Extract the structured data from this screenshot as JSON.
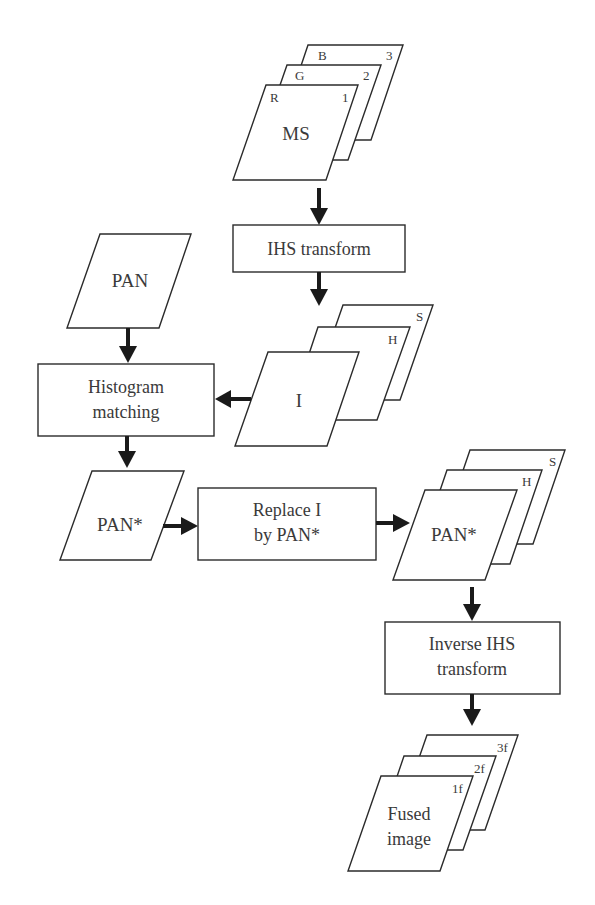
{
  "diagram": {
    "type": "flowchart",
    "colors": {
      "stroke": "#2b2b2b",
      "arrow": "#1a1a1a",
      "text": "#3a3a3a",
      "background": "#ffffff"
    },
    "ms_stack": {
      "label": "MS",
      "sheets": [
        {
          "band": "B",
          "index": "3"
        },
        {
          "band": "G",
          "index": "2"
        },
        {
          "band": "R",
          "index": "1"
        }
      ]
    },
    "ihs_transform": {
      "label": "IHS transform"
    },
    "pan": {
      "label": "PAN"
    },
    "ihs_stack": {
      "label": "I",
      "sheets": [
        {
          "band": "S"
        },
        {
          "band": "H"
        }
      ]
    },
    "histogram_matching": {
      "line1": "Histogram",
      "line2": "matching"
    },
    "pan_star": {
      "label": "PAN*"
    },
    "replace": {
      "line1": "Replace I",
      "line2": "by PAN*"
    },
    "replaced_stack": {
      "label": "PAN*",
      "sheets": [
        {
          "band": "S"
        },
        {
          "band": "H"
        }
      ]
    },
    "inverse_ihs": {
      "line1": "Inverse IHS",
      "line2": "transform"
    },
    "fused_stack": {
      "line1": "Fused",
      "line2": "image",
      "sheets": [
        {
          "index": "3f"
        },
        {
          "index": "2f"
        },
        {
          "index": "1f"
        }
      ]
    },
    "edges": [
      {
        "from": "MS",
        "to": "IHS transform"
      },
      {
        "from": "IHS transform",
        "to": "I/H/S"
      },
      {
        "from": "PAN",
        "to": "Histogram matching"
      },
      {
        "from": "I",
        "to": "Histogram matching"
      },
      {
        "from": "Histogram matching",
        "to": "PAN*"
      },
      {
        "from": "PAN*",
        "to": "Replace I by PAN*"
      },
      {
        "from": "Replace I by PAN*",
        "to": "PAN*/H/S"
      },
      {
        "from": "PAN*/H/S",
        "to": "Inverse IHS transform"
      },
      {
        "from": "Inverse IHS transform",
        "to": "Fused image"
      }
    ]
  }
}
